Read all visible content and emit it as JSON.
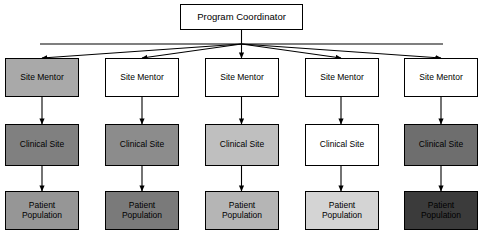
{
  "diagram": {
    "type": "organizational-hierarchy",
    "title_node": {
      "label": "Program Coordinator",
      "fill": "#ffffff",
      "text_color": "#000000"
    },
    "levels": [
      {
        "name": "coordinator",
        "label": "Program Coordinator"
      },
      {
        "name": "site-mentor",
        "label": "Site Mentor"
      },
      {
        "name": "clinical-site",
        "label": "Clinical Site"
      },
      {
        "name": "patient-population",
        "label": "Patient Population"
      }
    ],
    "columns": [
      {
        "index": 1,
        "mentor": {
          "label": "Site Mentor",
          "fill": "#a9a9a9",
          "text_color": "#000000"
        },
        "site": {
          "label": "Clinical Site",
          "fill": "#808080",
          "text_color": "#000000"
        },
        "patients": {
          "label": "Patient Population",
          "line1": "Patient",
          "line2": "Population",
          "fill": "#969696",
          "text_color": "#000000"
        }
      },
      {
        "index": 2,
        "mentor": {
          "label": "Site Mentor",
          "fill": "#ffffff",
          "text_color": "#000000"
        },
        "site": {
          "label": "Clinical Site",
          "fill": "#8c8c8c",
          "text_color": "#000000"
        },
        "patients": {
          "label": "Patient Population",
          "line1": "Patient",
          "line2": "Population",
          "fill": "#7a7a7a",
          "text_color": "#000000"
        }
      },
      {
        "index": 3,
        "mentor": {
          "label": "Site Mentor",
          "fill": "#ffffff",
          "text_color": "#000000"
        },
        "site": {
          "label": "Clinical Site",
          "fill": "#bfbfbf",
          "text_color": "#000000"
        },
        "patients": {
          "label": "Patient Population",
          "line1": "Patient",
          "line2": "Population",
          "fill": "#b5b5b5",
          "text_color": "#000000"
        }
      },
      {
        "index": 4,
        "mentor": {
          "label": "Site Mentor",
          "fill": "#ffffff",
          "text_color": "#000000"
        },
        "site": {
          "label": "Clinical Site",
          "fill": "#ffffff",
          "text_color": "#000000"
        },
        "patients": {
          "label": "Patient Population",
          "line1": "Patient",
          "line2": "Population",
          "fill": "#d4d4d4",
          "text_color": "#000000"
        }
      },
      {
        "index": 5,
        "mentor": {
          "label": "Site Mentor",
          "fill": "#ffffff",
          "text_color": "#000000"
        },
        "site": {
          "label": "Clinical Site",
          "fill": "#6e6e6e",
          "text_color": "#000000"
        },
        "patients": {
          "label": "Patient Population",
          "line1": "Patient",
          "line2": "Population",
          "fill": "#3b3b3b",
          "text_color": "#000000"
        }
      }
    ],
    "edge_color": "#000000",
    "background": "#ffffff"
  }
}
